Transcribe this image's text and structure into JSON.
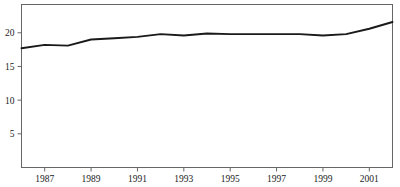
{
  "chart_data": {
    "type": "line",
    "title": "",
    "subtitle": "",
    "xlabel": "",
    "ylabel": "",
    "xlim": [
      1986,
      2002
    ],
    "ylim": [
      0,
      24.2
    ],
    "grid": false,
    "legend": null,
    "line_color": "#1a1a1a",
    "axis_color": "#666666",
    "frame": "box",
    "x_tick_labels": [
      "1987",
      "1989",
      "1991",
      "1993",
      "1995",
      "1997",
      "1999",
      "2001"
    ],
    "x_ticks": [
      1987,
      1989,
      1991,
      1993,
      1995,
      1997,
      1999,
      2001
    ],
    "y_tick_labels": [
      "5",
      "10",
      "15",
      "20"
    ],
    "y_ticks": [
      5,
      10,
      15,
      20
    ],
    "x": [
      1986,
      1987,
      1988,
      1989,
      1990,
      1991,
      1992,
      1993,
      1994,
      1995,
      1996,
      1997,
      1998,
      1999,
      2000,
      2001,
      2002
    ],
    "values": [
      17.7,
      18.2,
      18.1,
      19.0,
      19.2,
      19.4,
      19.8,
      19.6,
      19.9,
      19.8,
      19.8,
      19.8,
      19.8,
      19.6,
      19.8,
      20.6,
      21.6
    ],
    "series": [
      {
        "name": "series-1",
        "values": [
          17.7,
          18.2,
          18.1,
          19.0,
          19.2,
          19.4,
          19.8,
          19.6,
          19.9,
          19.8,
          19.8,
          19.8,
          19.8,
          19.6,
          19.8,
          20.6,
          21.6
        ]
      }
    ]
  }
}
